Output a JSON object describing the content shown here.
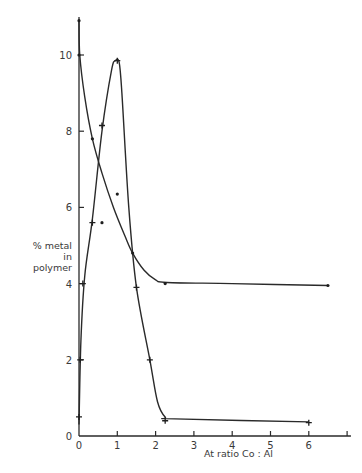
{
  "chart_data": {
    "type": "line",
    "title": "",
    "xlabel": "At ratio Co:Al",
    "ylabel": "% metal in polymer",
    "xlim": [
      0,
      7
    ],
    "ylim": [
      0,
      11
    ],
    "x_ticks": [
      "0",
      "1",
      "2",
      "3",
      "4",
      "5",
      "6"
    ],
    "y_ticks": [
      "0",
      "2",
      "4",
      "6",
      "8",
      "10"
    ],
    "grid": false,
    "legend": null,
    "series": [
      {
        "name": "curve A (peaked, + markers)",
        "marker": "+",
        "points": [
          [
            0.0,
            0.5
          ],
          [
            0.03,
            2.0
          ],
          [
            0.1,
            4.0
          ],
          [
            0.35,
            5.6
          ],
          [
            0.6,
            8.15
          ],
          [
            1.0,
            9.85
          ],
          [
            1.5,
            3.9
          ],
          [
            1.85,
            2.0
          ],
          [
            2.25,
            0.4
          ],
          [
            6.0,
            0.35
          ]
        ],
        "curve": [
          [
            0.0,
            0.3
          ],
          [
            0.05,
            2.5
          ],
          [
            0.15,
            4.2
          ],
          [
            0.35,
            5.7
          ],
          [
            0.6,
            8.0
          ],
          [
            0.85,
            9.6
          ],
          [
            0.95,
            9.85
          ],
          [
            1.05,
            9.8
          ],
          [
            1.12,
            9.0
          ],
          [
            1.3,
            6.0
          ],
          [
            1.5,
            3.9
          ],
          [
            1.85,
            2.0
          ],
          [
            2.05,
            0.9
          ],
          [
            2.25,
            0.5
          ],
          [
            2.5,
            0.45
          ],
          [
            6.0,
            0.37
          ]
        ]
      },
      {
        "name": "curve B (decaying, dot markers)",
        "marker": "dot",
        "points": [
          [
            0.0,
            10.9
          ],
          [
            0.0,
            10.0
          ],
          [
            0.35,
            7.8
          ],
          [
            1.4,
            4.8
          ],
          [
            2.25,
            4.0
          ],
          [
            6.5,
            3.95
          ]
        ],
        "curve": [
          [
            0.0,
            10.9
          ],
          [
            0.02,
            10.0
          ],
          [
            0.15,
            8.9
          ],
          [
            0.35,
            7.8
          ],
          [
            0.6,
            6.9
          ],
          [
            0.9,
            6.0
          ],
          [
            1.2,
            5.25
          ],
          [
            1.4,
            4.8
          ],
          [
            1.7,
            4.35
          ],
          [
            2.0,
            4.1
          ],
          [
            2.3,
            4.03
          ],
          [
            4.0,
            4.0
          ],
          [
            6.5,
            3.95
          ]
        ]
      }
    ],
    "extra_points": [
      {
        "marker": "dot",
        "x": 0.6,
        "y": 5.6
      },
      {
        "marker": "dot",
        "x": 1.0,
        "y": 6.35
      }
    ]
  },
  "labels": {
    "ylabel_line1": "% metal",
    "ylabel_line2": "in polymer",
    "xlabel": "At ratio  Co : Al"
  }
}
